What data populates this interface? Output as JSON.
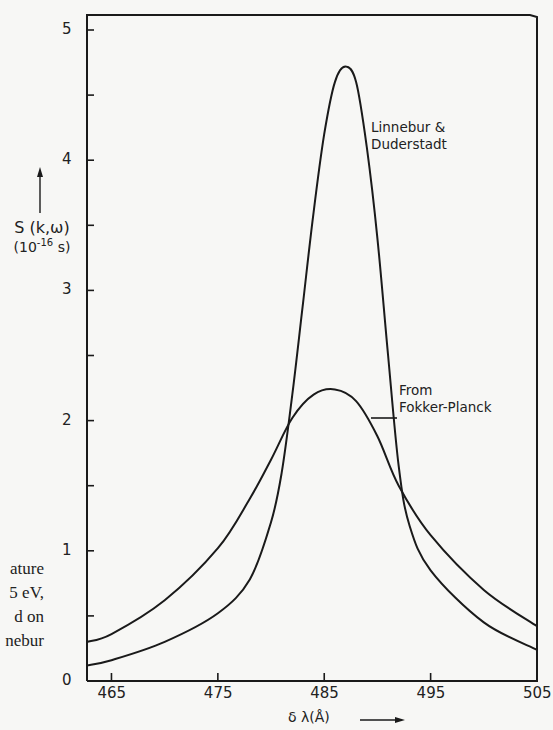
{
  "chart_data": {
    "type": "line",
    "title": "",
    "xlabel": "δ λ(Å)",
    "ylabel": "S (k,ω) (10^-16 s)",
    "ylabel_line1": "S (k,ω)",
    "ylabel_line2_base": "(10",
    "ylabel_line2_exp": "-16",
    "ylabel_line2_unit": " s)",
    "xlim": [
      462.7,
      505
    ],
    "ylim": [
      0,
      5.12
    ],
    "grid": false,
    "legend": "inline annotations",
    "x_ticks": [
      465,
      475,
      485,
      495,
      505
    ],
    "x_tick_labels": [
      "465",
      "475",
      "485",
      "495",
      "505"
    ],
    "x_minor_ticks": [],
    "y_ticks": [
      0,
      1,
      2,
      3,
      4,
      5
    ],
    "y_tick_labels": [
      "0",
      "1",
      "2",
      "3",
      "4",
      "5"
    ],
    "y_minor_ticks": [
      0.5,
      1.5,
      2.5,
      3.5,
      4.5
    ],
    "series": [
      {
        "name": "Linnebur & Duderstadt",
        "x": [
          462.7,
          465,
          470,
          475,
          478,
          480,
          481,
          482,
          483,
          484,
          485,
          486,
          487,
          488,
          489,
          490,
          491,
          492,
          493,
          495,
          500,
          505
        ],
        "values": [
          0.12,
          0.16,
          0.3,
          0.52,
          0.78,
          1.22,
          1.6,
          2.2,
          2.9,
          3.6,
          4.2,
          4.6,
          4.72,
          4.6,
          4.1,
          3.4,
          2.5,
          1.65,
          1.2,
          0.85,
          0.45,
          0.24
        ]
      },
      {
        "name": "From Fokker-Planck",
        "x": [
          462.7,
          465,
          470,
          475,
          478,
          480,
          482,
          484,
          486,
          488,
          490,
          492,
          495,
          500,
          505
        ],
        "values": [
          0.3,
          0.36,
          0.62,
          1.02,
          1.4,
          1.7,
          2.02,
          2.2,
          2.24,
          2.15,
          1.88,
          1.5,
          1.12,
          0.7,
          0.42
        ]
      }
    ],
    "annotations": [
      {
        "line1": "Linnebur &",
        "line2": "Duderstadt"
      },
      {
        "line1": "From",
        "line2": "Fokker-Planck"
      }
    ]
  },
  "side_text": {
    "lines": [
      "ature",
      "5 eV,",
      "d on",
      "nebur"
    ]
  },
  "colors": {
    "ink": "#1a1a1a",
    "background": "#f7f7f5"
  }
}
